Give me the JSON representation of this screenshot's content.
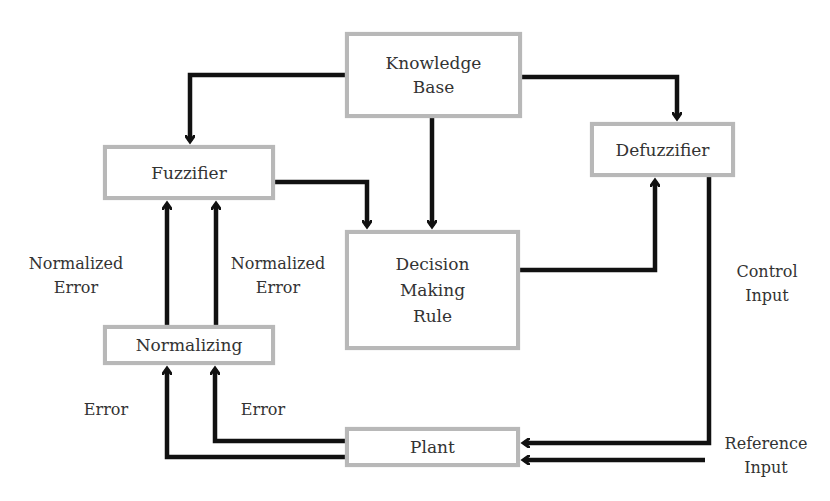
{
  "diagram": {
    "type": "fuzzy logic controller block diagram",
    "colors": {
      "box_border": "#b8b8b8",
      "arrow": "#111111",
      "text": "#333333",
      "background": "#ffffff"
    },
    "blocks": {
      "knowledge_base": {
        "line1": "Knowledge",
        "line2": "Base"
      },
      "fuzzifier": {
        "label": "Fuzzifier"
      },
      "defuzzifier": {
        "label": "Defuzzifier"
      },
      "decision": {
        "line1": "Decision",
        "line2": "Making",
        "line3": "Rule"
      },
      "normalizing": {
        "label": "Normalizing"
      },
      "plant": {
        "label": "Plant"
      }
    },
    "labels": {
      "normalized_error_left": {
        "line1": "Normalized",
        "line2": "Error"
      },
      "normalized_error_right": {
        "line1": "Normalized",
        "line2": "Error"
      },
      "error_left": "Error",
      "error_right": "Error",
      "control_input": {
        "line1": "Control",
        "line2": "Input"
      },
      "reference_input": {
        "line1": "Reference",
        "line2": "Input"
      }
    },
    "connections": [
      {
        "from": "Knowledge Base",
        "to": "Fuzzifier"
      },
      {
        "from": "Knowledge Base",
        "to": "Defuzzifier"
      },
      {
        "from": "Knowledge Base",
        "to": "Decision Making Rule"
      },
      {
        "from": "Fuzzifier",
        "to": "Decision Making Rule"
      },
      {
        "from": "Decision Making Rule",
        "to": "Defuzzifier"
      },
      {
        "from": "Defuzzifier",
        "to": "Plant",
        "label": "Control Input"
      },
      {
        "from": "Reference Input",
        "to": "Plant"
      },
      {
        "from": "Plant",
        "to": "Normalizing",
        "label": "Error"
      },
      {
        "from": "Plant",
        "to": "Normalizing",
        "label": "Error"
      },
      {
        "from": "Normalizing",
        "to": "Fuzzifier",
        "label": "Normalized Error"
      },
      {
        "from": "Normalizing",
        "to": "Fuzzifier",
        "label": "Normalized Error"
      }
    ]
  }
}
